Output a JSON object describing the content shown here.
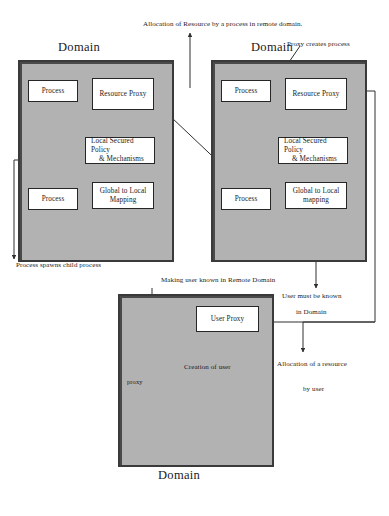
{
  "diagram": {
    "title_top": "Allocation of Resource by a process in remote domain.",
    "domains": {
      "left": {
        "title": "Domain",
        "nodes": {
          "process_top": "Process",
          "resource_proxy": "Resource Proxy",
          "policy_line1": "Local Secured Policy",
          "policy_line2": "& Mechanisms",
          "process_bottom": "Process",
          "mapping_line1": "Global to Local",
          "mapping_line2": "Mapping"
        }
      },
      "right": {
        "title": "Domain",
        "nodes": {
          "process_top": "Process",
          "resource_proxy": "Resource Proxy",
          "policy_line1": "Local Secured Policy",
          "policy_line2": "& Mechanisms",
          "process_bottom": "Process",
          "mapping_line1": "Global to Local",
          "mapping_line2": "mapping"
        }
      },
      "bottom": {
        "title": "Domain",
        "nodes": {
          "user_proxy": "User Proxy"
        },
        "figure_label": "proxy"
      }
    },
    "labels": {
      "proxy_creates_process": "Proxy creates process",
      "process_spawns_child": "Process spawns child process",
      "making_user_known": "Making user known in Remote Domain",
      "user_must_be_known_line1": "User must be known",
      "user_must_be_known_line2": "in Domain",
      "creation_of_user": "Creation of user",
      "allocation_resource_line1": "Allocation of a resource",
      "allocation_resource_line2": "by user"
    },
    "colors": {
      "domain_fill": "#b2b2b2",
      "domain_border": "#2b2b2b",
      "node_fill": "#ffffff",
      "node_border": "#262626",
      "line": "#303030",
      "page_background": "#ffffff"
    }
  }
}
